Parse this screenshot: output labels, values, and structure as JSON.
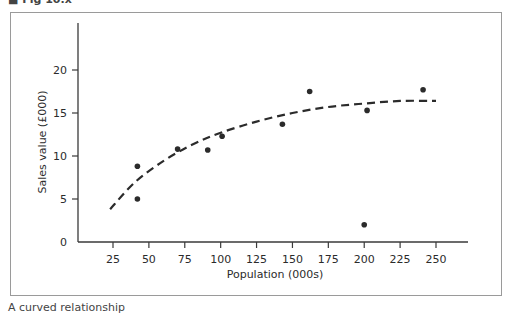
{
  "figure": {
    "top_caption": "■ Fig 10.x",
    "bottom_caption": "A curved relationship"
  },
  "chart_data": {
    "type": "scatter",
    "title": "",
    "xlabel": "Population (000s)",
    "ylabel": "Sales value (£000)",
    "xlim": [
      0,
      275
    ],
    "ylim": [
      0,
      25
    ],
    "x_ticks": [
      25,
      50,
      75,
      100,
      125,
      150,
      175,
      200,
      225,
      250
    ],
    "y_ticks": [
      0,
      5,
      10,
      15,
      20
    ],
    "grid": false,
    "legend": null,
    "series": [
      {
        "name": "Observations",
        "type": "scatter",
        "points": [
          {
            "x": 42,
            "y": 8.8
          },
          {
            "x": 42,
            "y": 5.0
          },
          {
            "x": 70,
            "y": 10.8
          },
          {
            "x": 91,
            "y": 10.7
          },
          {
            "x": 101,
            "y": 12.3
          },
          {
            "x": 143,
            "y": 13.7
          },
          {
            "x": 162,
            "y": 17.5
          },
          {
            "x": 200,
            "y": 2.0
          },
          {
            "x": 202,
            "y": 15.3
          },
          {
            "x": 241,
            "y": 17.7
          }
        ]
      },
      {
        "name": "Fitted curve",
        "type": "line",
        "style": "dashed",
        "points": [
          {
            "x": 23,
            "y": 3.8
          },
          {
            "x": 40,
            "y": 6.9
          },
          {
            "x": 60,
            "y": 9.4
          },
          {
            "x": 80,
            "y": 11.3
          },
          {
            "x": 100,
            "y": 12.7
          },
          {
            "x": 125,
            "y": 14.0
          },
          {
            "x": 150,
            "y": 15.0
          },
          {
            "x": 175,
            "y": 15.7
          },
          {
            "x": 200,
            "y": 16.1
          },
          {
            "x": 225,
            "y": 16.4
          },
          {
            "x": 250,
            "y": 16.4
          }
        ]
      }
    ],
    "colors": {
      "points": "#2b2b2b",
      "curve": "#2b2b2b",
      "axis": "#3a3a3a",
      "frame": "#9a9a9a"
    }
  }
}
